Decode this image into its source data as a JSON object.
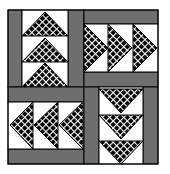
{
  "quilt": {
    "colors": {
      "background": "#ffffff",
      "gray": "#6e6e6e",
      "fill": "#000000",
      "lattice": "#ffffff",
      "outline": "#000000",
      "white": "#ffffff"
    },
    "blocks": [
      {
        "position": "top-left",
        "direction": "up",
        "triangles": 3
      },
      {
        "position": "top-right",
        "direction": "right",
        "triangles": 3
      },
      {
        "position": "bottom-left",
        "direction": "left",
        "triangles": 3
      },
      {
        "position": "bottom-right",
        "direction": "down",
        "triangles": 3
      }
    ]
  }
}
